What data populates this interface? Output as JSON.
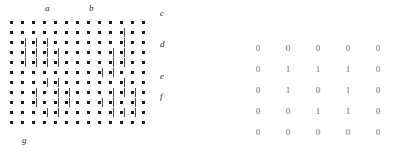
{
  "figure": {
    "dot_color": "#1a1a1a",
    "bar_color": "#4a4a4a",
    "matrix_text_color": "#6e6e6e"
  },
  "lattice": {
    "rows": 11,
    "cols": 13,
    "labels": {
      "a": "a",
      "b": "b",
      "c": "c",
      "d": "d",
      "e": "e",
      "f": "f",
      "g": "g"
    },
    "bars": [
      [],
      [
        10
      ],
      [
        1,
        2,
        3,
        10
      ],
      [
        1,
        2,
        3,
        4,
        9,
        10
      ],
      [
        1,
        2,
        3,
        4,
        9,
        10
      ],
      [
        8,
        9
      ],
      [
        3,
        4,
        10
      ],
      [
        2,
        4,
        5,
        9,
        10,
        11
      ],
      [
        2,
        4,
        5,
        8,
        9,
        11
      ],
      [
        3,
        4,
        9,
        10,
        11
      ],
      []
    ]
  },
  "chart_data": {
    "type": "heatmap",
    "title": "",
    "rows": 5,
    "cols": 5,
    "values": [
      [
        0,
        0,
        0,
        0,
        0
      ],
      [
        0,
        1,
        1,
        1,
        0
      ],
      [
        0,
        1,
        0,
        1,
        0
      ],
      [
        0,
        0,
        1,
        1,
        0
      ],
      [
        0,
        0,
        0,
        0,
        0
      ]
    ]
  }
}
